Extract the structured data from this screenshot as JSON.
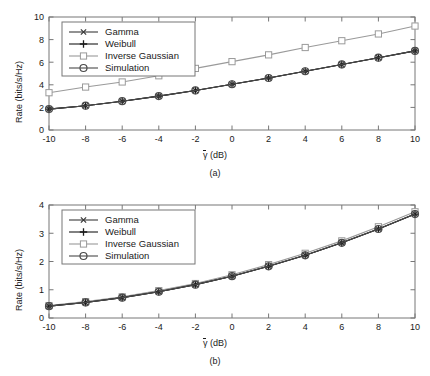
{
  "figure": {
    "background": "#ffffff",
    "axis_color": "#777777",
    "text_color": "#1a1a1a"
  },
  "panels": [
    {
      "id": "a",
      "caption": "(a)",
      "ylabel": "Rate (bits/s/Hz)",
      "xlabel_symbol": "γ",
      "xlabel_unit": " (dB)",
      "legend": [
        {
          "label": "Gamma",
          "marker": "cross-x",
          "color": "#3a3a3a"
        },
        {
          "label": "Weibull",
          "marker": "plus",
          "color": "#1a1a1a"
        },
        {
          "label": "Inverse Gaussian",
          "marker": "square",
          "color": "#9a9a9a"
        },
        {
          "label": "Simulation",
          "marker": "circle",
          "color": "#4a4a4a"
        }
      ]
    },
    {
      "id": "b",
      "caption": "(b)",
      "ylabel": "Rate (bits/s/Hz)",
      "xlabel_symbol": "γ",
      "xlabel_unit": " (dB)",
      "legend": [
        {
          "label": "Gamma",
          "marker": "cross-x",
          "color": "#3a3a3a"
        },
        {
          "label": "Weibull",
          "marker": "plus",
          "color": "#1a1a1a"
        },
        {
          "label": "Inverse Gaussian",
          "marker": "square",
          "color": "#9a9a9a"
        },
        {
          "label": "Simulation",
          "marker": "circle",
          "color": "#4a4a4a"
        }
      ]
    }
  ],
  "chart_data": [
    {
      "type": "line",
      "panel": "a",
      "title": "",
      "xlabel": "γ̄ (dB)",
      "ylabel": "Rate (bits/s/Hz)",
      "xlim": [
        -10,
        10
      ],
      "ylim": [
        0,
        10
      ],
      "xticks": [
        -10,
        -8,
        -6,
        -4,
        -2,
        0,
        2,
        4,
        6,
        8,
        10
      ],
      "yticks": [
        0,
        2,
        4,
        6,
        8,
        10
      ],
      "xtick_labels": [
        "-10",
        "-8",
        "-6",
        "-4",
        "-2",
        "0",
        "2",
        "4",
        "6",
        "8",
        "10"
      ],
      "ytick_labels": [
        "0",
        "2",
        "4",
        "6",
        "8",
        "10"
      ],
      "grid": false,
      "legend_position": "upper left",
      "x": [
        -10,
        -8,
        -6,
        -4,
        -2,
        0,
        2,
        4,
        6,
        8,
        10
      ],
      "series": [
        {
          "name": "Gamma",
          "marker": "cross-x",
          "color": "#3a3a3a",
          "values": [
            1.85,
            2.15,
            2.55,
            3.0,
            3.5,
            4.05,
            4.6,
            5.2,
            5.8,
            6.4,
            7.0
          ]
        },
        {
          "name": "Weibull",
          "marker": "plus",
          "color": "#1a1a1a",
          "values": [
            1.85,
            2.15,
            2.55,
            3.0,
            3.5,
            4.05,
            4.6,
            5.2,
            5.8,
            6.4,
            7.0
          ]
        },
        {
          "name": "Inverse Gaussian",
          "marker": "square",
          "color": "#9a9a9a",
          "values": [
            3.3,
            3.8,
            4.25,
            4.8,
            5.45,
            6.05,
            6.65,
            7.3,
            7.9,
            8.5,
            9.2
          ]
        },
        {
          "name": "Simulation",
          "marker": "circle",
          "color": "#4a4a4a",
          "values": [
            1.85,
            2.15,
            2.55,
            3.0,
            3.5,
            4.05,
            4.6,
            5.2,
            5.8,
            6.4,
            7.0
          ]
        }
      ]
    },
    {
      "type": "line",
      "panel": "b",
      "title": "",
      "xlabel": "γ̄ (dB)",
      "ylabel": "Rate (bits/s/Hz)",
      "xlim": [
        -10,
        10
      ],
      "ylim": [
        0,
        4
      ],
      "xticks": [
        -10,
        -8,
        -6,
        -4,
        -2,
        0,
        2,
        4,
        6,
        8,
        10
      ],
      "yticks": [
        0,
        1,
        2,
        3,
        4
      ],
      "xtick_labels": [
        "-10",
        "-8",
        "-6",
        "-4",
        "-2",
        "0",
        "2",
        "4",
        "6",
        "8",
        "10"
      ],
      "ytick_labels": [
        "0",
        "1",
        "2",
        "3",
        "4"
      ],
      "grid": false,
      "legend_position": "upper left",
      "x": [
        -10,
        -8,
        -6,
        -4,
        -2,
        0,
        2,
        4,
        6,
        8,
        10
      ],
      "series": [
        {
          "name": "Gamma",
          "marker": "cross-x",
          "color": "#3a3a3a",
          "values": [
            0.42,
            0.55,
            0.72,
            0.93,
            1.18,
            1.48,
            1.83,
            2.22,
            2.66,
            3.15,
            3.68
          ]
        },
        {
          "name": "Weibull",
          "marker": "plus",
          "color": "#1a1a1a",
          "values": [
            0.42,
            0.55,
            0.72,
            0.93,
            1.18,
            1.48,
            1.83,
            2.22,
            2.66,
            3.15,
            3.68
          ]
        },
        {
          "name": "Inverse Gaussian",
          "marker": "square",
          "color": "#9a9a9a",
          "values": [
            0.44,
            0.58,
            0.75,
            0.97,
            1.22,
            1.53,
            1.89,
            2.29,
            2.73,
            3.23,
            3.76
          ]
        },
        {
          "name": "Simulation",
          "marker": "circle",
          "color": "#4a4a4a",
          "values": [
            0.42,
            0.55,
            0.72,
            0.93,
            1.18,
            1.48,
            1.83,
            2.22,
            2.66,
            3.15,
            3.68
          ]
        }
      ]
    }
  ]
}
